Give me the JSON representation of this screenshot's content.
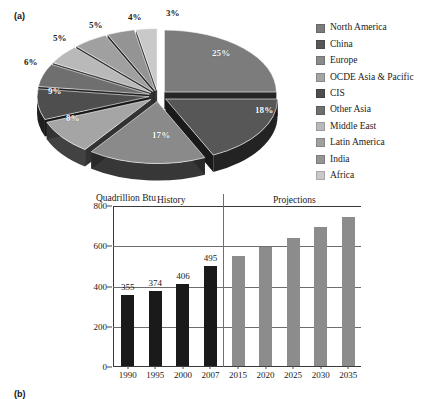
{
  "figure": {
    "panel_a_label": "(a)",
    "panel_b_label": "(b)"
  },
  "legend": {
    "items": [
      {
        "label": "North America",
        "color": "#7c7c7c"
      },
      {
        "label": "China",
        "color": "#575757"
      },
      {
        "label": "Europe",
        "color": "#8a8a8a"
      },
      {
        "label": "OCDE Asia & Pacific",
        "color": "#a5a5a5"
      },
      {
        "label": "CIS",
        "color": "#4e4e4e"
      },
      {
        "label": "Other Asia",
        "color": "#6f6f6f"
      },
      {
        "label": "Middle East",
        "color": "#b9b9b9"
      },
      {
        "label": "Latin America",
        "color": "#a0a0a0"
      },
      {
        "label": "India",
        "color": "#949494"
      },
      {
        "label": "Africa",
        "color": "#c9c9c9"
      }
    ]
  },
  "chart_data": [
    {
      "type": "pie",
      "title": "",
      "panel": "(a)",
      "legend_position": "right",
      "labels": [
        "North America",
        "China",
        "Europe",
        "OCDE Asia & Pacific",
        "CIS",
        "Other Asia",
        "Middle East",
        "Latin America",
        "India",
        "Africa"
      ],
      "values": [
        25,
        18,
        17,
        9,
        8,
        6,
        5,
        5,
        4,
        3
      ],
      "value_labels": [
        "25%",
        "18%",
        "17%",
        "9%",
        "8%",
        "6%",
        "5%",
        "5%",
        "4%",
        "3%"
      ],
      "colors": [
        "#7c7c7c",
        "#575757",
        "#8a8a8a",
        "#a5a5a5",
        "#4e4e4e",
        "#6f6f6f",
        "#b9b9b9",
        "#a0a0a0",
        "#949494",
        "#c9c9c9"
      ],
      "exploded": true,
      "three_d": true
    },
    {
      "type": "bar",
      "panel": "(b)",
      "title": "",
      "ylabel": "Quadrillion Btu",
      "xlabel": "",
      "ylim": [
        0,
        800
      ],
      "yticks": [
        0,
        200,
        400,
        600,
        800
      ],
      "ytick_labels": [
        "0",
        "200",
        "400",
        "600",
        "800"
      ],
      "grid": true,
      "categories": [
        "1990",
        "1995",
        "2000",
        "2007",
        "2015",
        "2020",
        "2025",
        "2030",
        "2035"
      ],
      "values": [
        355,
        374,
        406,
        495,
        545,
        590,
        635,
        690,
        740
      ],
      "value_labels": [
        "355",
        "374",
        "406",
        "495",
        "",
        "",
        "",
        "",
        ""
      ],
      "bar_colors": [
        "#1a1a1a",
        "#1a1a1a",
        "#1a1a1a",
        "#1a1a1a",
        "#8c8c8c",
        "#8c8c8c",
        "#8c8c8c",
        "#8c8c8c",
        "#8c8c8c"
      ],
      "annotations": [
        {
          "text": "History",
          "region": "left"
        },
        {
          "text": "Projections",
          "region": "right"
        }
      ],
      "divider_after_category": "2007"
    }
  ]
}
